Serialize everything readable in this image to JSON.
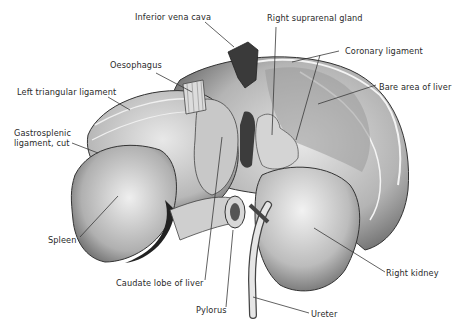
{
  "figure": {
    "type": "anatomical illustration",
    "palette": {
      "background": "#ffffff",
      "ink": "#2a2a2a",
      "organ_light": "#d9d9d9",
      "organ_mid": "#a8a8a8",
      "organ_dark": "#4a4a4a",
      "vessel": "#3c3c3c"
    }
  },
  "labels": {
    "ivc": "Inferior vena cava",
    "suprarenal": "Right suprarenal gland",
    "coronary": "Coronary ligament",
    "bare_area": "Bare area of liver",
    "oesophagus": "Oesophagus",
    "left_triangular": "Left triangular ligament",
    "gastrosplenic_1": "Gastrosplenic",
    "gastrosplenic_2": "ligament, cut",
    "spleen": "Spleen",
    "caudate": "Caudate lobe of liver",
    "pylorus": "Pylorus",
    "ureter": "Ureter",
    "right_kidney": "Right kidney"
  }
}
